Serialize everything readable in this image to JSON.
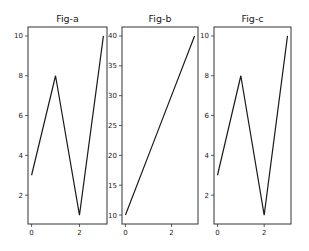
{
  "chart_data": [
    {
      "type": "line",
      "title": "Fig-a",
      "x": [
        0,
        1,
        2,
        3
      ],
      "series": [
        {
          "name": "",
          "values": [
            3,
            8,
            1,
            10
          ]
        }
      ],
      "xlabel": "",
      "ylabel": "",
      "xlim": [
        -0.15,
        3.15
      ],
      "ylim": [
        0.55,
        10.45
      ],
      "xticks": [
        0,
        2
      ],
      "yticks": [
        2,
        4,
        6,
        8,
        10
      ],
      "grid": false
    },
    {
      "type": "line",
      "title": "Fig-b",
      "x": [
        0,
        1,
        2,
        3
      ],
      "series": [
        {
          "name": "",
          "values": [
            10,
            20,
            30,
            40
          ]
        }
      ],
      "xlabel": "",
      "ylabel": "",
      "xlim": [
        -0.15,
        3.15
      ],
      "ylim": [
        8.5,
        41.5
      ],
      "xticks": [
        0,
        2
      ],
      "yticks": [
        10,
        15,
        20,
        25,
        30,
        35,
        40
      ],
      "grid": false
    },
    {
      "type": "line",
      "title": "Fig-c",
      "x": [
        0,
        1,
        2,
        3
      ],
      "series": [
        {
          "name": "",
          "values": [
            3,
            8,
            1,
            10
          ]
        }
      ],
      "xlabel": "",
      "ylabel": "",
      "xlim": [
        -0.15,
        3.15
      ],
      "ylim": [
        0.55,
        10.45
      ],
      "xticks": [
        0,
        2
      ],
      "yticks": [
        2,
        4,
        6,
        8,
        10
      ],
      "grid": false
    }
  ]
}
